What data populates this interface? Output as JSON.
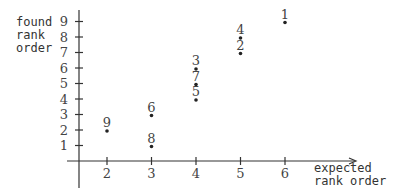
{
  "chart_data": {
    "type": "scatter",
    "title": "",
    "xlabel": [
      "expected",
      "rank order"
    ],
    "ylabel": [
      "found",
      "rank",
      "order"
    ],
    "x_ticks": [
      2,
      3,
      4,
      5,
      6
    ],
    "y_ticks": [
      1,
      2,
      3,
      4,
      5,
      6,
      7,
      8,
      9
    ],
    "xlim": [
      1.4,
      7.6
    ],
    "ylim": [
      0,
      9.5
    ],
    "grid": false,
    "points": [
      {
        "label": "1",
        "x": 6,
        "y": 9
      },
      {
        "label": "2",
        "x": 5,
        "y": 7
      },
      {
        "label": "3",
        "x": 4,
        "y": 6
      },
      {
        "label": "4",
        "x": 5,
        "y": 8
      },
      {
        "label": "5",
        "x": 4,
        "y": 4
      },
      {
        "label": "6",
        "x": 3,
        "y": 3
      },
      {
        "label": "7",
        "x": 4,
        "y": 5
      },
      {
        "label": "8",
        "x": 3,
        "y": 1
      },
      {
        "label": "9",
        "x": 2,
        "y": 2
      }
    ]
  }
}
